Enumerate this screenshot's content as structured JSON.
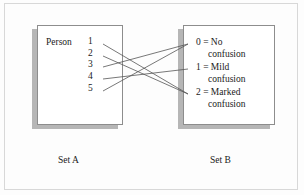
{
  "diagram": {
    "title": "",
    "type": "set-mapping",
    "stroke_color": "#555555",
    "box_border_color": "#8d8d8d",
    "shadow_color": "#b6b6b6",
    "set_a": {
      "caption": "Set A",
      "header": "Person",
      "items": [
        {
          "label": "1",
          "x": 96,
          "y": 44
        },
        {
          "label": "2",
          "x": 96,
          "y": 56
        },
        {
          "label": "3",
          "x": 96,
          "y": 67
        },
        {
          "label": "4",
          "x": 96,
          "y": 79
        },
        {
          "label": "5",
          "x": 96,
          "y": 91
        }
      ]
    },
    "set_b": {
      "caption": "Set B",
      "items": [
        {
          "key": "0",
          "line1": "0 = No",
          "line2": "confusion",
          "x": 193,
          "y": 44
        },
        {
          "key": "1",
          "line1": "1 = Mild",
          "line2": "confusion",
          "x": 193,
          "y": 69
        },
        {
          "key": "2",
          "line1": "2 = Marked",
          "line2": "confusion",
          "x": 193,
          "y": 94
        }
      ]
    },
    "links": [
      {
        "from": "1",
        "to": "2",
        "x1": 103,
        "y1": 44,
        "x2": 188,
        "y2": 94
      },
      {
        "from": "2",
        "to": "2",
        "x1": 103,
        "y1": 56,
        "x2": 188,
        "y2": 94
      },
      {
        "from": "3",
        "to": "0",
        "x1": 103,
        "y1": 67,
        "x2": 188,
        "y2": 44
      },
      {
        "from": "4",
        "to": "1",
        "x1": 103,
        "y1": 79,
        "x2": 188,
        "y2": 69
      },
      {
        "from": "5",
        "to": "0",
        "x1": 103,
        "y1": 91,
        "x2": 188,
        "y2": 44
      }
    ]
  }
}
